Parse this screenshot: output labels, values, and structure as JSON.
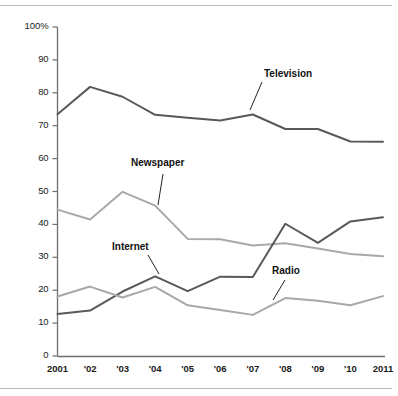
{
  "chart_data": {
    "type": "line",
    "title": "",
    "subtitle": "",
    "xlabel": "",
    "ylabel": "",
    "grid": false,
    "legend_position": "inline-annotations",
    "x": [
      2001,
      2002,
      2003,
      2004,
      2005,
      2006,
      2007,
      2008,
      2009,
      2010,
      2011
    ],
    "categories": [
      "2001",
      "'02",
      "'03",
      "'04",
      "'05",
      "'06",
      "'07",
      "'08",
      "'09",
      "'10",
      "2011"
    ],
    "ylim": [
      0,
      100
    ],
    "xlim": [
      2001,
      2011
    ],
    "yticks": [
      "0",
      "10",
      "20",
      "30",
      "40",
      "50",
      "60",
      "70",
      "80",
      "90",
      "100%"
    ],
    "ytick_values": [
      0,
      10,
      20,
      30,
      40,
      50,
      60,
      70,
      80,
      90,
      100
    ],
    "series": [
      {
        "name": "Television",
        "color": "#595959",
        "values": [
          73.5,
          81.8,
          78.8,
          73.3,
          72.4,
          71.6,
          73.4,
          69.0,
          69.0,
          65.2,
          65.1
        ]
      },
      {
        "name": "Newspaper",
        "color": "#a8a8a8",
        "values": [
          44.5,
          41.5,
          49.9,
          45.7,
          35.6,
          35.5,
          33.6,
          34.3,
          32.7,
          31.0,
          30.3
        ]
      },
      {
        "name": "Internet",
        "color": "#595959",
        "values": [
          12.8,
          13.8,
          19.6,
          24.2,
          19.7,
          24.1,
          24.0,
          40.2,
          34.4,
          40.9,
          42.2
        ]
      },
      {
        "name": "Radio",
        "color": "#a8a8a8",
        "values": [
          18.1,
          21.1,
          17.8,
          21.0,
          15.4,
          14.0,
          12.5,
          17.6,
          16.8,
          15.4,
          18.2
        ]
      }
    ],
    "annotations": [
      {
        "label": "Television",
        "x": 264,
        "y": 68,
        "leader": {
          "x1": 262,
          "y1": 82,
          "x2": 250,
          "y2": 110
        }
      },
      {
        "label": "Newspaper",
        "x": 131,
        "y": 157,
        "leader": {
          "x1": 163,
          "y1": 174,
          "x2": 158,
          "y2": 205
        }
      },
      {
        "label": "Internet",
        "x": 112,
        "y": 241,
        "leader": {
          "x1": 148,
          "y1": 255,
          "x2": 159,
          "y2": 274
        }
      },
      {
        "label": "Radio",
        "x": 272,
        "y": 265,
        "leader": {
          "x1": 285,
          "y1": 280,
          "x2": 273,
          "y2": 300
        }
      }
    ]
  },
  "axis": {
    "y_labels": [
      "100%",
      "90",
      "80",
      "70",
      "60",
      "50",
      "40",
      "30",
      "20",
      "10",
      "0"
    ],
    "x_labels": [
      "2001",
      "'02",
      "'03",
      "'04",
      "'05",
      "'06",
      "'07",
      "'08",
      "'09",
      "'10",
      "2011"
    ]
  },
  "colors": {
    "dark_series": "#595959",
    "light_series": "#a8a8a8",
    "axis": "#6e6e6e",
    "frame": "#b9b9b9",
    "text": "#1a1a1a",
    "background": "#ffffff"
  }
}
